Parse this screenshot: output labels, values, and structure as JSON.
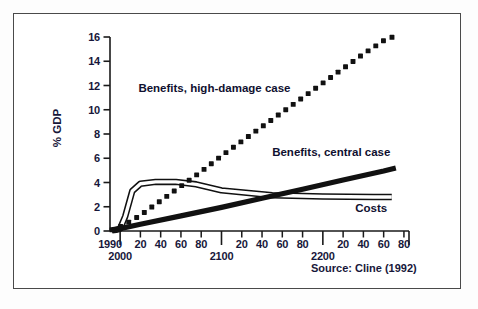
{
  "chart_data": {
    "type": "line",
    "title": "",
    "subtitle": "",
    "xlabel": "",
    "ylabel": "% GDP",
    "ylim": [
      0,
      16
    ],
    "yticks": [
      0,
      2,
      4,
      6,
      8,
      10,
      12,
      14,
      16
    ],
    "ytick_labels": [
      "0",
      "2",
      "4",
      "6",
      "8",
      "10",
      "12",
      "14",
      "16"
    ],
    "xlim": [
      1990,
      2285
    ],
    "grid": false,
    "legend_position": "inline-annotations",
    "source": "Source: Cline (1992)",
    "xtick_labels_upper": [
      "1990",
      "20",
      "40",
      "60",
      "80",
      "20",
      "40",
      "60",
      "80",
      "20",
      "40",
      "60",
      "80"
    ],
    "xtick_values_upper": [
      1990,
      2020,
      2040,
      2060,
      2080,
      2120,
      2140,
      2160,
      2180,
      2220,
      2240,
      2260,
      2280
    ],
    "xtick_labels_lower": [
      "2000",
      "2100",
      "2200"
    ],
    "xtick_values_lower": [
      2000,
      2100,
      2200
    ],
    "series": [
      {
        "name": "Benefits, high-damage case",
        "style": "dotted",
        "label": "Benefits, high-damage case",
        "x": [
          1992,
          2000,
          2010,
          2020,
          2030,
          2040,
          2050,
          2060,
          2070,
          2080,
          2100,
          2120,
          2140,
          2160,
          2180,
          2200,
          2220,
          2240,
          2260,
          2275
        ],
        "y": [
          0.1,
          0.35,
          0.8,
          1.3,
          1.9,
          2.5,
          3.1,
          3.7,
          4.3,
          4.9,
          6.2,
          7.4,
          8.6,
          9.8,
          11.0,
          12.2,
          13.4,
          14.6,
          15.7,
          16.2
        ]
      },
      {
        "name": "Benefits, central case",
        "style": "thick-solid",
        "label": "Benefits, central case",
        "x": [
          1992,
          2020,
          2060,
          2100,
          2140,
          2180,
          2220,
          2260,
          2272
        ],
        "y": [
          0.05,
          0.55,
          1.25,
          1.95,
          2.7,
          3.45,
          4.2,
          4.95,
          5.2
        ]
      },
      {
        "name": "Costs",
        "style": "double-thin",
        "label": "Costs",
        "x": [
          1992,
          1996,
          2000,
          2005,
          2012,
          2020,
          2035,
          2055,
          2075,
          2100,
          2150,
          2200,
          2250,
          2268
        ],
        "y": [
          0.05,
          0.1,
          0.2,
          1.2,
          3.3,
          3.9,
          4.05,
          4.05,
          3.85,
          3.35,
          2.95,
          2.85,
          2.8,
          2.8
        ]
      }
    ],
    "annotations": [
      {
        "text": "Benefits, high-damage case",
        "x": 2018,
        "y": 11.7
      },
      {
        "text": "Benefits, central case",
        "x": 2150,
        "y": 6.4
      },
      {
        "text": "Costs",
        "x": 2232,
        "y": 1.85
      }
    ]
  }
}
